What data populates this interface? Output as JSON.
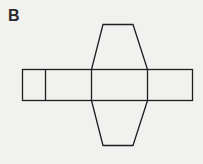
{
  "figure": {
    "label": "B",
    "stroke_color": "#1e1e1e",
    "background": "#f1f1f0"
  }
}
